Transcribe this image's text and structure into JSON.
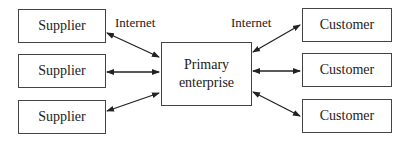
{
  "diagram": {
    "center": {
      "label_line1": "Primary",
      "label_line2": "enterprise"
    },
    "suppliers": [
      {
        "label": "Supplier"
      },
      {
        "label": "Supplier"
      },
      {
        "label": "Supplier"
      }
    ],
    "customers": [
      {
        "label": "Customer"
      },
      {
        "label": "Customer"
      },
      {
        "label": "Customer"
      }
    ],
    "edge_labels": {
      "left": "Internet",
      "right": "Internet"
    }
  }
}
